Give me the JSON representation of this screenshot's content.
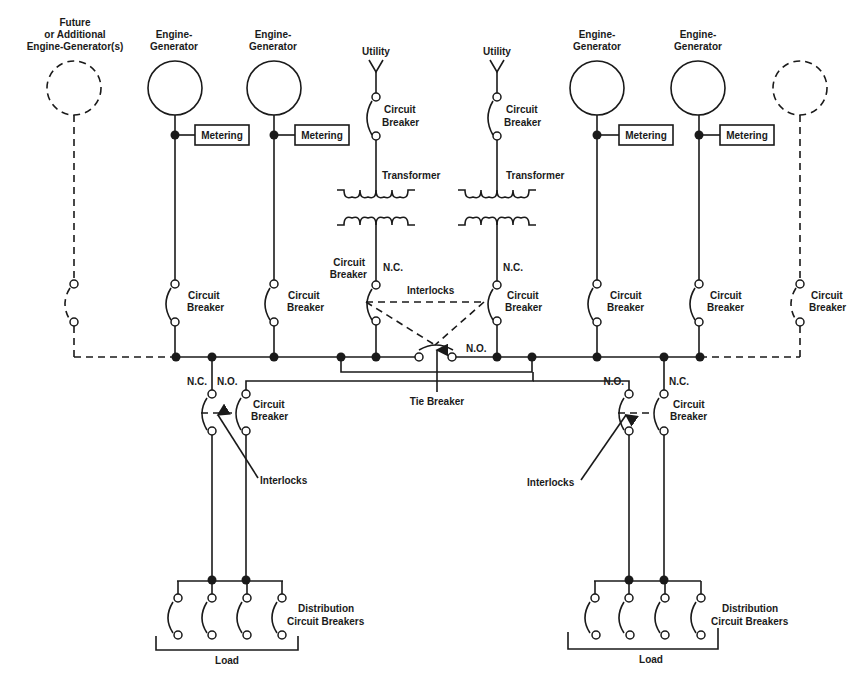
{
  "diagram": {
    "labels": {
      "future_gen": [
        "Future",
        "or Additional",
        "Engine-Generator(s)"
      ],
      "engine_generator": [
        "Engine-",
        "Generator"
      ],
      "metering": "Metering",
      "utility": "Utility",
      "circuit_breaker": [
        "Circuit",
        "Breaker"
      ],
      "transformer": "Transformer",
      "nc": "N.C.",
      "no": "N.O.",
      "interlocks": "Interlocks",
      "tie_breaker": "Tie Breaker",
      "distribution": [
        "Distribution",
        "Circuit Breakers"
      ],
      "load": "Load"
    },
    "nodes": [
      {
        "id": "future-gen-left",
        "type": "generator",
        "dashed": true
      },
      {
        "id": "gen-1",
        "type": "generator",
        "label": "Engine-Generator",
        "metering": true
      },
      {
        "id": "gen-2",
        "type": "generator",
        "label": "Engine-Generator",
        "metering": true
      },
      {
        "id": "utility-1",
        "type": "utility",
        "label": "Utility"
      },
      {
        "id": "utility-2",
        "type": "utility",
        "label": "Utility"
      },
      {
        "id": "gen-3",
        "type": "generator",
        "label": "Engine-Generator",
        "metering": true
      },
      {
        "id": "gen-4",
        "type": "generator",
        "label": "Engine-Generator",
        "metering": true
      },
      {
        "id": "future-gen-right",
        "type": "generator",
        "dashed": true
      },
      {
        "id": "transformer-1",
        "type": "transformer"
      },
      {
        "id": "transformer-2",
        "type": "transformer"
      },
      {
        "id": "tie-breaker",
        "type": "breaker",
        "state": "N.O."
      },
      {
        "id": "load-left",
        "type": "load",
        "distribution_breakers": 4
      },
      {
        "id": "load-right",
        "type": "load",
        "distribution_breakers": 4
      }
    ],
    "edges": [
      {
        "from": "utility-1",
        "to": "transformer-1",
        "via": "circuit breaker"
      },
      {
        "from": "transformer-1",
        "to": "left-bus",
        "via": "circuit breaker N.C."
      },
      {
        "from": "utility-2",
        "to": "transformer-2",
        "via": "circuit breaker"
      },
      {
        "from": "transformer-2",
        "to": "right-bus",
        "via": "circuit breaker N.C."
      },
      {
        "from": "left-bus",
        "to": "right-bus",
        "via": "tie breaker N.O."
      },
      {
        "from": "gen-1",
        "to": "left-bus",
        "via": "circuit breaker"
      },
      {
        "from": "gen-2",
        "to": "left-bus",
        "via": "circuit breaker"
      },
      {
        "from": "gen-3",
        "to": "right-bus",
        "via": "circuit breaker"
      },
      {
        "from": "gen-4",
        "to": "right-bus",
        "via": "circuit breaker"
      },
      {
        "from": "left-bus",
        "to": "load-left",
        "via": "circuit breaker N.C."
      },
      {
        "from": "right-bus",
        "to": "load-left",
        "via": "circuit breaker N.O."
      },
      {
        "from": "right-bus",
        "to": "load-right",
        "via": "circuit breaker N.C."
      },
      {
        "from": "left-bus",
        "to": "load-right",
        "via": "circuit breaker N.O."
      }
    ]
  }
}
